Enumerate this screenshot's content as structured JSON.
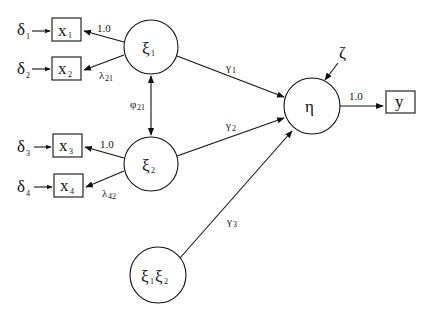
{
  "diagram": {
    "type": "structural-equation-model",
    "latent": {
      "xi1": {
        "label": "ξ",
        "sub": "1"
      },
      "xi2": {
        "label": "ξ",
        "sub": "2"
      },
      "eta": {
        "label": "η"
      },
      "interaction": {
        "label1": "ξ",
        "sub1": "1",
        "label2": "ξ",
        "sub2": "2"
      }
    },
    "observed": {
      "x1": {
        "label": "x",
        "sub": "1"
      },
      "x2": {
        "label": "x",
        "sub": "2"
      },
      "x3": {
        "label": "x",
        "sub": "3"
      },
      "x4": {
        "label": "x",
        "sub": "4"
      },
      "y": {
        "label": "y"
      }
    },
    "errors": {
      "d1": {
        "label": "δ",
        "sub": "1"
      },
      "d2": {
        "label": "δ",
        "sub": "2"
      },
      "d3": {
        "label": "δ",
        "sub": "3"
      },
      "d4": {
        "label": "δ",
        "sub": "4"
      },
      "zeta": {
        "label": "ζ"
      }
    },
    "paths": {
      "xi1_x1": "1.0",
      "xi1_x2": {
        "label": "λ",
        "sub": "21"
      },
      "xi2_x3": "1.0",
      "xi2_x4": {
        "label": "λ",
        "sub": "42"
      },
      "phi": {
        "label": "φ",
        "sub": "21"
      },
      "gamma1": {
        "label": "γ",
        "sub": "1"
      },
      "gamma2": {
        "label": "γ",
        "sub": "2"
      },
      "gamma3": {
        "label": "γ",
        "sub": "3"
      },
      "eta_y": "1.0"
    }
  }
}
